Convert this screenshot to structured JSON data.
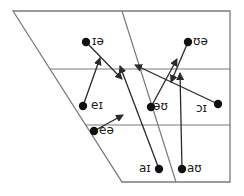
{
  "diagram": {
    "title": "",
    "colors": {
      "line": "#7a7a7a",
      "arrow": "#2a2a2a",
      "dot": "#111111",
      "background": "#ffffff"
    },
    "grid": {
      "outline": [
        [
          13,
          11
        ],
        [
          230,
          11
        ],
        [
          230,
          182
        ],
        [
          122,
          182
        ]
      ],
      "vertical_divider": [
        [
          122,
          11
        ],
        [
          176,
          182
        ]
      ],
      "horizontal_lines": [
        {
          "y": 69,
          "x1": 50,
          "x2": 230
        },
        {
          "y": 125,
          "x1": 86,
          "x2": 230
        }
      ]
    },
    "points": [
      {
        "id": "ia",
        "label": "ɪə",
        "x": 86,
        "y": 42,
        "lx": 92,
        "ly": 35
      },
      {
        "id": "ua",
        "label": "ʊə",
        "x": 188,
        "y": 42,
        "lx": 193,
        "ly": 35
      },
      {
        "id": "ei",
        "label": "eɪ",
        "x": 83,
        "y": 106,
        "lx": 91,
        "ly": 99
      },
      {
        "id": "au_o",
        "label": "əʊ",
        "x": 151,
        "y": 107,
        "lx": 153,
        "ly": 100
      },
      {
        "id": "oi",
        "label": "ɔɪ",
        "x": 218,
        "y": 104,
        "lx": 196,
        "ly": 102
      },
      {
        "id": "ea",
        "label": "eə",
        "x": 94,
        "y": 131,
        "lx": 99,
        "ly": 124
      },
      {
        "id": "ai",
        "label": "aɪ",
        "x": 159,
        "y": 169,
        "lx": 139,
        "ly": 162
      },
      {
        "id": "aw",
        "label": "aʊ",
        "x": 182,
        "y": 169,
        "lx": 187,
        "ly": 162
      }
    ],
    "arrows": [
      {
        "from": "ia",
        "x1": 86,
        "y1": 42,
        "x2": 122,
        "y2": 79
      },
      {
        "from": "ei",
        "x1": 83,
        "y1": 106,
        "x2": 100,
        "y2": 58
      },
      {
        "from": "ea",
        "x1": 94,
        "y1": 131,
        "x2": 123,
        "y2": 115
      },
      {
        "from": "ai",
        "x1": 159,
        "y1": 169,
        "x2": 120,
        "y2": 66
      },
      {
        "from": "au_o",
        "x1": 151,
        "y1": 107,
        "x2": 177,
        "y2": 59
      },
      {
        "from": "ua",
        "x1": 188,
        "y1": 42,
        "x2": 171,
        "y2": 82
      },
      {
        "from": "oi",
        "x1": 218,
        "y1": 104,
        "x2": 135,
        "y2": 65
      },
      {
        "from": "aw",
        "x1": 182,
        "y1": 169,
        "x2": 180,
        "y2": 73
      }
    ]
  }
}
